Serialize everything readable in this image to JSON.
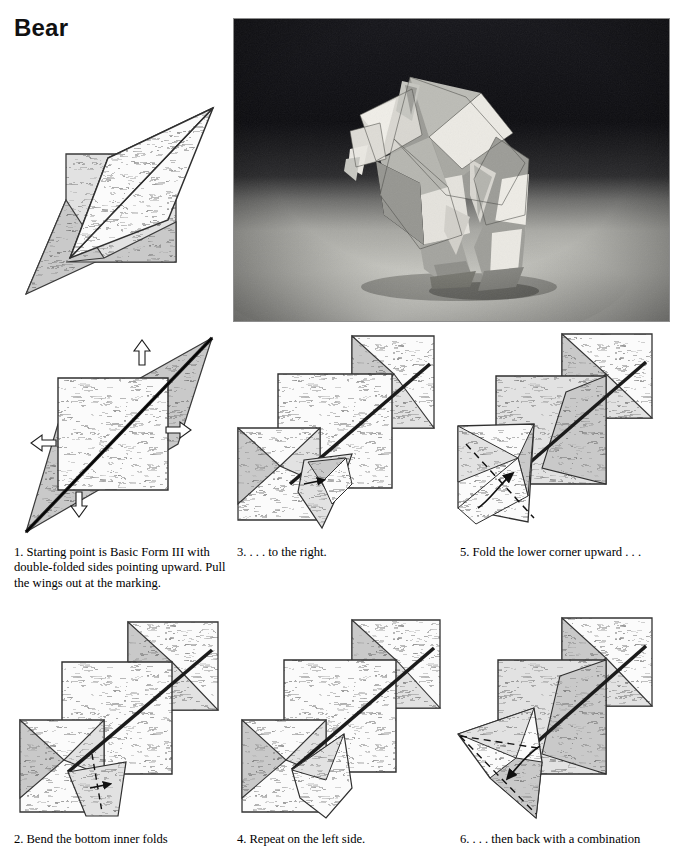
{
  "page": {
    "title": "Bear",
    "background_color": "#ffffff",
    "text_color": "#000000"
  },
  "photo": {
    "name": "finished-bear-photograph",
    "subject": "folded origami bear model",
    "style": "black and white photograph",
    "background_color": "#111111",
    "paper_light_color": "#e8e6e0",
    "paper_mid_color": "#9a9a95",
    "paper_dark_color": "#6e6e6a"
  },
  "diagrams": {
    "paper_fill": "#f2f2f2",
    "paper_shade_light": "#dcdcdc",
    "paper_shade_mid": "#c2c2c2",
    "paper_shade_dark": "#a8a8a8",
    "line_color": "#333333",
    "fold_line_color": "#1a1a1a",
    "items": [
      {
        "id": "basic-form",
        "label": "Basic Form III starting shape",
        "step_number": ""
      },
      {
        "id": "step-1",
        "label": "Pull wings out at marking",
        "step_number": "1"
      },
      {
        "id": "step-3",
        "label": "Fold to the right",
        "step_number": "3"
      },
      {
        "id": "step-5",
        "label": "Fold lower corner upward",
        "step_number": "5"
      },
      {
        "id": "step-2",
        "label": "Bend bottom inner folds",
        "step_number": "2"
      },
      {
        "id": "step-4",
        "label": "Repeat on the left side",
        "step_number": "4"
      },
      {
        "id": "step-6",
        "label": "Back with a combination fold",
        "step_number": "6"
      }
    ]
  },
  "captions": {
    "c1": {
      "number": "1.",
      "text": "Starting point is Basic Form III with double-folded sides pointing upward. Pull the wings out at the marking."
    },
    "c2": {
      "number": "2.",
      "text": "Bend the bottom inner folds"
    },
    "c3": {
      "number": "3.",
      "text": ". . . to the right."
    },
    "c4": {
      "number": "4.",
      "text": "Repeat on the left side."
    },
    "c5": {
      "number": "5.",
      "text": "Fold the lower corner upward . . ."
    },
    "c6": {
      "number": "6.",
      "text": ". . . then back with a combination"
    }
  }
}
